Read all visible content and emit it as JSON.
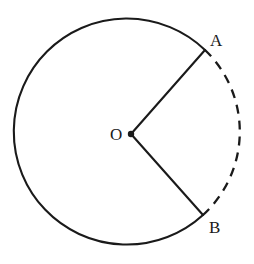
{
  "figure": {
    "background_color": "#ffffff",
    "stroke_color": "#1a1a1a",
    "width": 254,
    "height": 264
  },
  "labels": {
    "center": "O",
    "point_a": "A",
    "point_b": "B"
  },
  "geometry": {
    "center": {
      "x": 131,
      "y": 134
    },
    "radius": 113,
    "point_a": {
      "x": 205,
      "y": 50
    },
    "point_b": {
      "x": 203,
      "y": 215
    },
    "angle_a_degrees": -48.6,
    "angle_b_degrees": 48.4,
    "solid_arc_description": "major arc from B counterclockwise through left side to A",
    "dashed_arc_description": "minor arc from A clockwise through right side to B",
    "radii": [
      {
        "from": "O",
        "to": "A",
        "style": "solid"
      },
      {
        "from": "O",
        "to": "B",
        "style": "solid"
      }
    ],
    "center_dot_radius": 3.2,
    "stroke_width": 2,
    "dash_pattern": "9 7"
  },
  "paths": {
    "solid_arc": "M 203 215 A 113 113 0 1 1 205 50",
    "dashed_arc": "M 205 50 A 113 113 0 0 1 203 215",
    "radius_oa": "M 131 134 L 205 50",
    "radius_ob": "M 131 134 L 203 215"
  }
}
